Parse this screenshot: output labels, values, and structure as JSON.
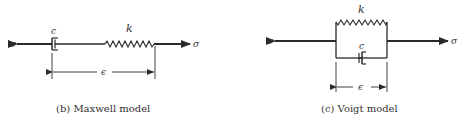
{
  "figures": [
    {
      "id": "maxwell",
      "caption": "(b) Maxwell model",
      "labels": {
        "stress_left": "σ",
        "stress_right": "σ",
        "damper": "c",
        "spring": "k",
        "strain": "ϵ"
      },
      "arrangement": "series"
    },
    {
      "id": "voigt",
      "caption": "(c) Voigt model",
      "labels": {
        "stress_left": "σ",
        "stress_right": "σ",
        "damper": "c",
        "spring": "k",
        "strain": "ϵ"
      },
      "arrangement": "parallel"
    }
  ],
  "colors": {
    "line": "#2a2a2a",
    "text": "#333333"
  }
}
